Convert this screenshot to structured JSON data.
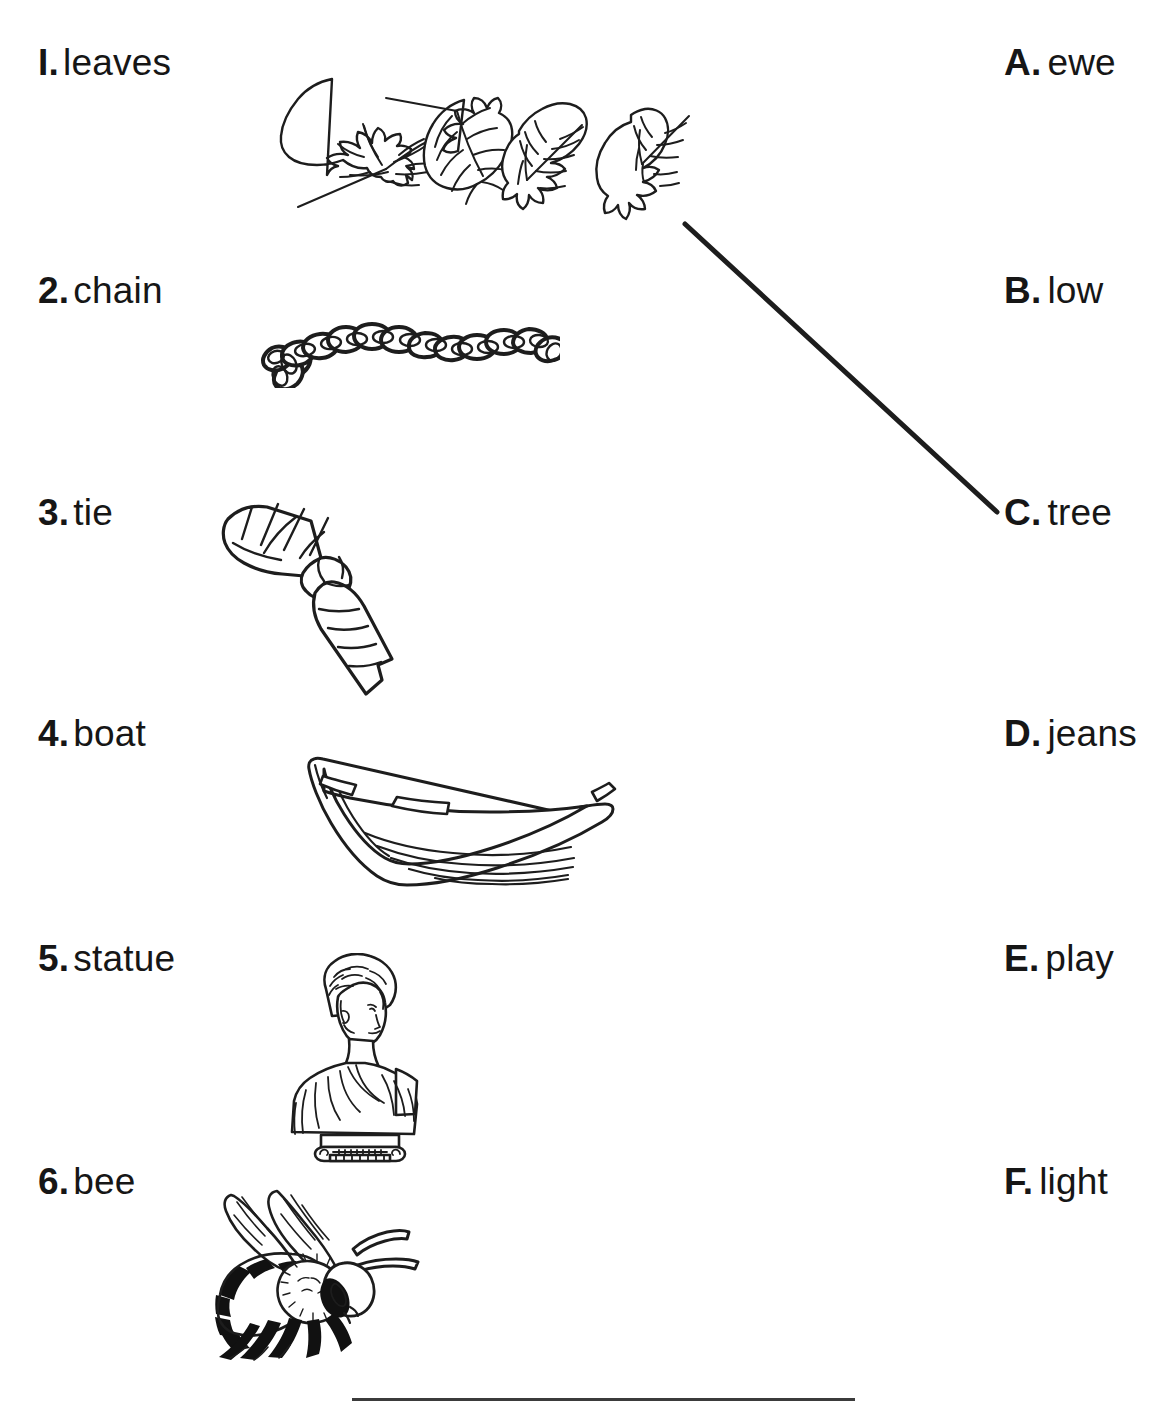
{
  "worksheet": {
    "left_column": [
      {
        "marker": "I.",
        "word": "leaves",
        "picture": "leaves-illustration"
      },
      {
        "marker": "2.",
        "word": "chain",
        "picture": "chain-illustration"
      },
      {
        "marker": "3.",
        "word": "tie",
        "picture": "necktie-illustration"
      },
      {
        "marker": "4.",
        "word": "boat",
        "picture": "rowboat-illustration"
      },
      {
        "marker": "5.",
        "word": "statue",
        "picture": "bust-statue-illustration"
      },
      {
        "marker": "6.",
        "word": "bee",
        "picture": "bee-illustration"
      }
    ],
    "right_column": [
      {
        "marker": "A.",
        "word": "ewe"
      },
      {
        "marker": "B.",
        "word": "low"
      },
      {
        "marker": "C.",
        "word": "tree"
      },
      {
        "marker": "D.",
        "word": "jeans"
      },
      {
        "marker": "E.",
        "word": "play"
      },
      {
        "marker": "F.",
        "word": "light"
      }
    ],
    "connections": [
      {
        "from": "1",
        "to": "C",
        "x1": 685,
        "y1": 224,
        "x2": 997,
        "y2": 512
      }
    ],
    "ink_color": "#1d1d1d",
    "page_color": "#ffffff"
  }
}
